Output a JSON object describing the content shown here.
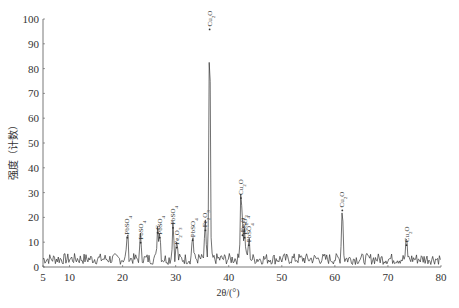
{
  "chart_data": {
    "type": "line",
    "title": "",
    "xlabel": "2θ/(°)",
    "ylabel": "强度（计数）",
    "xlim": [
      5,
      80
    ],
    "ylim": [
      0,
      100
    ],
    "x_ticks": [
      5,
      10,
      20,
      30,
      40,
      50,
      60,
      70,
      80
    ],
    "y_ticks": [
      0,
      10,
      20,
      30,
      40,
      50,
      60,
      70,
      80,
      90,
      100
    ],
    "grid": false,
    "legend": null,
    "peaks": [
      {
        "x": 20.9,
        "y": 11,
        "label": "PbSO4"
      },
      {
        "x": 23.4,
        "y": 9,
        "label": "PbSO4"
      },
      {
        "x": 26.6,
        "y": 13,
        "label": "C"
      },
      {
        "x": 27.0,
        "y": 11,
        "label": "PbSO4"
      },
      {
        "x": 29.5,
        "y": 15,
        "label": "PbSO4"
      },
      {
        "x": 30.2,
        "y": 7,
        "label": "Fe2O3"
      },
      {
        "x": 33.2,
        "y": 10,
        "label": "PbSO4"
      },
      {
        "x": 35.6,
        "y": 14,
        "label": "Fe2O3"
      },
      {
        "x": 36.4,
        "y": 95,
        "label": "Cu2O"
      },
      {
        "x": 42.3,
        "y": 27,
        "label": "Cu2O"
      },
      {
        "x": 42.6,
        "y": 12,
        "label": "Fe2O3"
      },
      {
        "x": 43.0,
        "y": 11,
        "label": "PbSO4"
      },
      {
        "x": 43.8,
        "y": 8,
        "label": "PbSO4"
      },
      {
        "x": 61.4,
        "y": 22,
        "label": "Cu2O"
      },
      {
        "x": 73.5,
        "y": 8,
        "label": "Cu2O"
      }
    ],
    "baseline_noise": [
      0,
      6
    ]
  },
  "labels": {
    "xlabel": "2θ/(°)",
    "ylabel": "强度（计数）"
  }
}
